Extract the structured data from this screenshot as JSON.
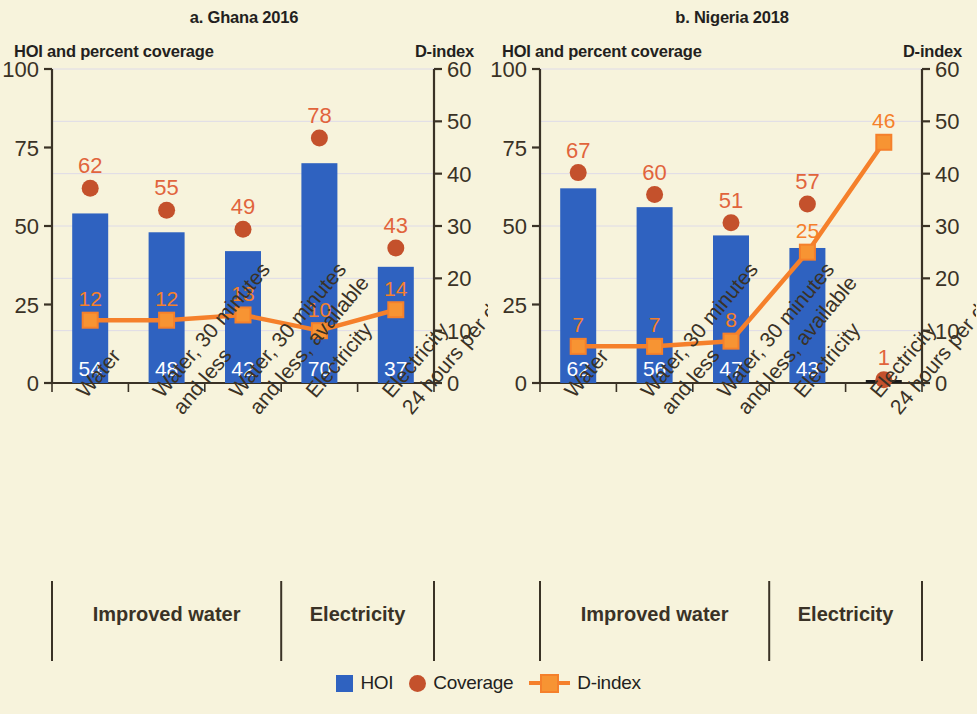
{
  "legend": {
    "hoi_label": "HOI",
    "coverage_label": "Coverage",
    "dindex_label": "D-index"
  },
  "colors": {
    "background": "#f7f3dc",
    "hoi_bar": "#2f62c0",
    "coverage_dot": "#c4512c",
    "coverage_text": "#e1643c",
    "dindex_line": "#f5802b",
    "dindex_fill": "#f79433",
    "axis": "#3a3226",
    "grid": "#dedbe8",
    "bar_value_text": "#ffffff"
  },
  "panels": [
    {
      "key": "ghana",
      "title": "a. Ghana 2016",
      "left_axis_title": "HOI and percent coverage",
      "right_axis_title": "D-index",
      "left_axis": {
        "ticks": [
          0,
          25,
          50,
          75,
          100
        ],
        "min": 0,
        "max": 100
      },
      "right_axis": {
        "ticks": [
          0,
          10,
          20,
          30,
          40,
          50,
          60
        ],
        "min": 0,
        "max": 60
      },
      "groups": [
        {
          "label": "Improved water",
          "span": 3
        },
        {
          "label": "Electricity",
          "span": 2
        }
      ],
      "chart_data": {
        "type": "bar",
        "title": "a. Ghana 2016",
        "xlabel": "",
        "ylabel": "HOI and percent coverage",
        "y2label": "D-index",
        "ylim": [
          0,
          100
        ],
        "y2lim": [
          0,
          60
        ],
        "grid": true,
        "legend_position": "bottom-center",
        "categories": [
          "Water",
          "Water, 30 minutes and less",
          "Water, 30 minutes and less, available",
          "Electricity",
          "Electricity 24 hours per day"
        ],
        "series": [
          {
            "name": "HOI",
            "type": "bar",
            "axis": "left",
            "values": [
              54,
              48,
              42,
              70,
              37
            ]
          },
          {
            "name": "Coverage",
            "type": "scatter",
            "axis": "left",
            "values": [
              62,
              55,
              49,
              78,
              43
            ]
          },
          {
            "name": "D-index",
            "type": "line",
            "axis": "right",
            "values": [
              12,
              12,
              13,
              10,
              14
            ]
          }
        ]
      }
    },
    {
      "key": "nigeria",
      "title": "b. Nigeria 2018",
      "left_axis_title": "HOI and percent coverage",
      "right_axis_title": "D-index",
      "left_axis": {
        "ticks": [
          0,
          25,
          50,
          75,
          100
        ],
        "min": 0,
        "max": 100
      },
      "right_axis": {
        "ticks": [
          0,
          10,
          20,
          30,
          40,
          50,
          60
        ],
        "min": 0,
        "max": 60
      },
      "groups": [
        {
          "label": "Improved water",
          "span": 3
        },
        {
          "label": "Electricity",
          "span": 2
        }
      ],
      "chart_data": {
        "type": "bar",
        "title": "b. Nigeria 2018",
        "xlabel": "",
        "ylabel": "HOI and percent coverage",
        "y2label": "D-index",
        "ylim": [
          0,
          100
        ],
        "y2lim": [
          0,
          60
        ],
        "grid": true,
        "legend_position": "bottom-center",
        "categories": [
          "Water",
          "Water, 30 minutes and less",
          "Water, 30 minutes and less, available",
          "Electricity",
          "Electricity 24 hours per day"
        ],
        "series": [
          {
            "name": "HOI",
            "type": "bar",
            "axis": "left",
            "values": [
              62,
              56,
              47,
              43,
              0
            ]
          },
          {
            "name": "Coverage",
            "type": "scatter",
            "axis": "left",
            "values": [
              67,
              60,
              51,
              57,
              1
            ]
          },
          {
            "name": "D-index",
            "type": "line",
            "axis": "right",
            "values": [
              7,
              7,
              8,
              25,
              46
            ]
          }
        ]
      }
    }
  ]
}
